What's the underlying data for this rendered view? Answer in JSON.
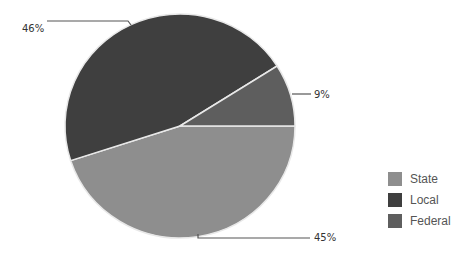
{
  "chart_data": {
    "type": "pie",
    "title": "",
    "categories": [
      "State",
      "Local",
      "Federal"
    ],
    "values": [
      45,
      46,
      9
    ],
    "unit": "%",
    "data_labels": [
      "45%",
      "46%",
      "9%"
    ],
    "colors": [
      "#8e8e8e",
      "#3f3f3f",
      "#5e5e5e"
    ],
    "start_angle_deg": 0,
    "direction": "clockwise",
    "legend_position": "right"
  },
  "labels": {
    "state": "45%",
    "local": "46%",
    "federal": "9%"
  },
  "legend": {
    "items": [
      {
        "label": "State",
        "color": "#8e8e8e"
      },
      {
        "label": "Local",
        "color": "#3f3f3f"
      },
      {
        "label": "Federal",
        "color": "#5e5e5e"
      }
    ]
  }
}
